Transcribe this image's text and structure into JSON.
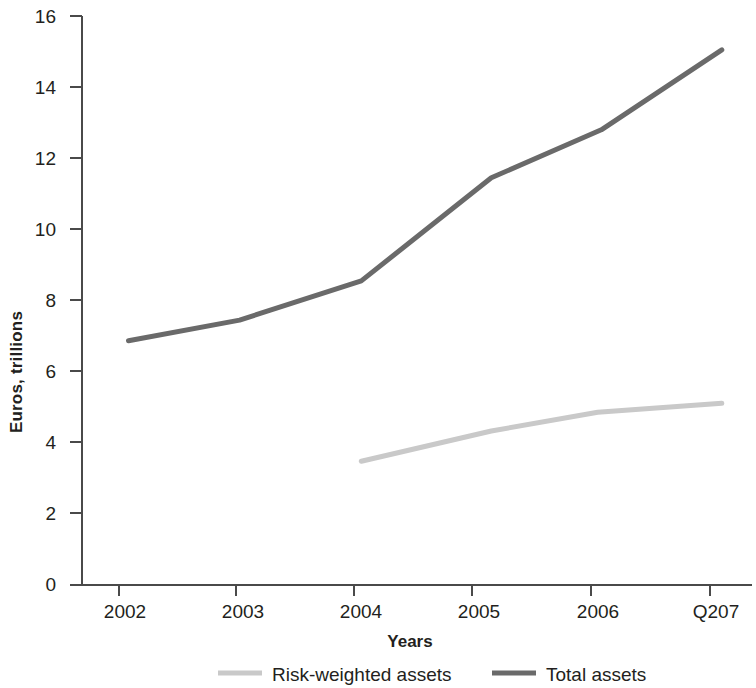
{
  "chart_data": {
    "type": "line",
    "title": "",
    "subtitle": "",
    "xlabel": "Years",
    "ylabel": "Euros, trillions",
    "categories": [
      "2002",
      "2003",
      "2004",
      "2005",
      "2006",
      "Q207"
    ],
    "x_tick_labels": [
      "2002",
      "2003",
      "2004",
      "2005",
      "2006",
      "Q207"
    ],
    "y_tick_labels": [
      "0",
      "2",
      "4",
      "6",
      "8",
      "10",
      "12",
      "14",
      "16"
    ],
    "y_tick_values": [
      0,
      2,
      4,
      6,
      8,
      10,
      12,
      14,
      16
    ],
    "ylim": [
      0,
      16
    ],
    "grid": false,
    "legend_position": "bottom",
    "series": [
      {
        "name": "Risk-weighted assets",
        "color": "#c9c9c9",
        "x": [
          2004.05,
          2005.15,
          2006.05,
          2007.1
        ],
        "values": [
          3.48,
          4.33,
          4.86,
          5.11
        ]
      },
      {
        "name": "Total assets",
        "color": "#6a6a6a",
        "x": [
          2002.08,
          2003.02,
          2004.05,
          2005.15,
          2006.08,
          2007.1
        ],
        "values": [
          6.87,
          7.45,
          8.55,
          11.45,
          12.8,
          15.05
        ]
      }
    ]
  },
  "axes": {
    "y_axis_title": "Euros, trillions",
    "x_axis_title": "Years"
  },
  "legend": {
    "items": [
      {
        "label": "Risk-weighted assets",
        "color": "#c9c9c9"
      },
      {
        "label": "Total assets",
        "color": "#6a6a6a"
      }
    ]
  },
  "colors": {
    "axis": "#4a4a4a",
    "text": "#231f20",
    "risk_weighted": "#c9c9c9",
    "total_assets": "#6a6a6a",
    "background": "#ffffff"
  }
}
